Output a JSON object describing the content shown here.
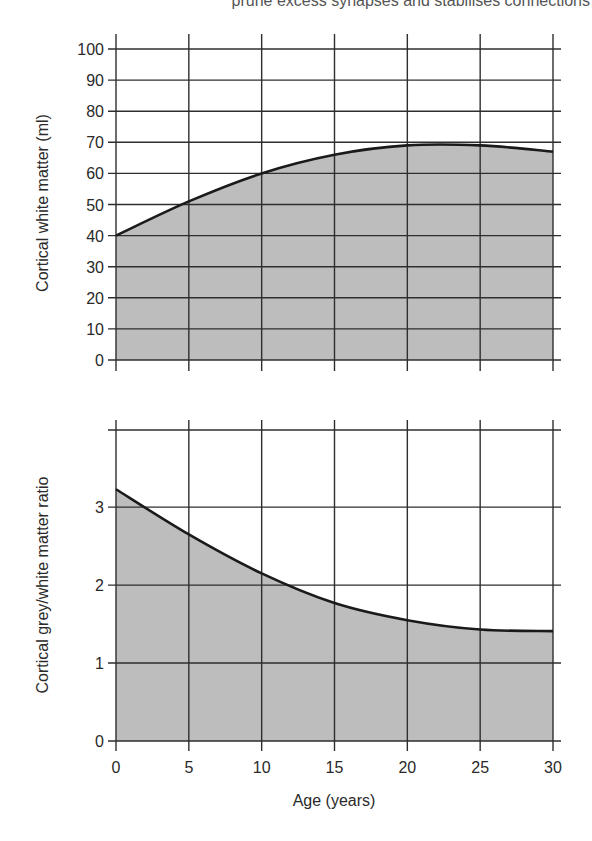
{
  "caption_top": "prune excess synapses and stabilises connections",
  "style": {
    "fill": "#bdbdbd",
    "grid": "#2e2e2e",
    "line": "#1a1a1a"
  },
  "chart_data": [
    {
      "type": "area",
      "title": "",
      "xlabel": "",
      "ylabel": "Cortical white matter (ml)",
      "x": [
        0,
        5,
        10,
        15,
        20,
        25,
        30
      ],
      "series": [
        {
          "name": "Cortical white matter",
          "values": [
            40,
            51,
            60,
            66,
            69,
            69,
            67
          ]
        }
      ],
      "xlim": [
        0,
        30
      ],
      "ylim": [
        0,
        100
      ],
      "yticks": [
        0,
        10,
        20,
        30,
        40,
        50,
        60,
        70,
        80,
        90,
        100
      ],
      "xticks": [
        0,
        5,
        10,
        15,
        20,
        25,
        30
      ],
      "grid": true,
      "legend": null
    },
    {
      "type": "area",
      "title": "",
      "xlabel": "Age (years)",
      "ylabel": "Cortical grey/white matter ratio",
      "x": [
        0,
        5,
        10,
        15,
        20,
        25,
        30
      ],
      "series": [
        {
          "name": "Grey/white matter ratio",
          "values": [
            3.23,
            2.65,
            2.15,
            1.77,
            1.55,
            1.43,
            1.41
          ]
        }
      ],
      "xlim": [
        0,
        30
      ],
      "ylim": [
        0,
        4
      ],
      "yticks": [
        0,
        1,
        2,
        3
      ],
      "xticks": [
        0,
        5,
        10,
        15,
        20,
        25,
        30
      ],
      "xtick_labels": [
        "0",
        "5",
        "10",
        "15",
        "20",
        "25",
        "30"
      ],
      "grid": true,
      "legend": null
    }
  ]
}
